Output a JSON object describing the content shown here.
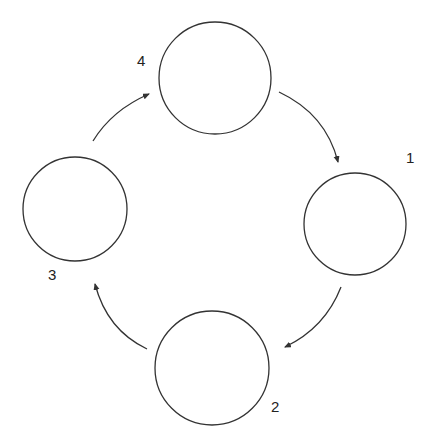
{
  "diagram": {
    "type": "cycle",
    "colors": {
      "stroke": "#333333",
      "text": "#222222",
      "background": "#ffffff"
    },
    "nodes": [
      {
        "id": "n1",
        "label": "1",
        "cx": 355,
        "cy": 224,
        "r": 51,
        "label_x": 406,
        "label_y": 163
      },
      {
        "id": "n2",
        "label": "2",
        "cx": 212,
        "cy": 368,
        "r": 57,
        "label_x": 271,
        "label_y": 412
      },
      {
        "id": "n3",
        "label": "3",
        "cx": 75,
        "cy": 209,
        "r": 52,
        "label_x": 48,
        "label_y": 280
      },
      {
        "id": "n4",
        "label": "4",
        "cx": 215,
        "cy": 78,
        "r": 56,
        "label_x": 137,
        "label_y": 66
      }
    ],
    "edges": [
      {
        "from": "n4",
        "to": "n1"
      },
      {
        "from": "n1",
        "to": "n2"
      },
      {
        "from": "n2",
        "to": "n3"
      },
      {
        "from": "n3",
        "to": "n4"
      }
    ]
  }
}
